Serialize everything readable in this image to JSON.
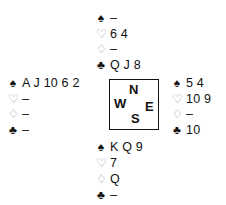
{
  "diagram": {
    "type": "bridge-hand-diagram",
    "compass": {
      "north": "N",
      "south": "S",
      "east": "E",
      "west": "W"
    },
    "hands": {
      "north": [
        {
          "suit": "spades",
          "symbol": "♠",
          "cards": "–"
        },
        {
          "suit": "hearts",
          "symbol": "♡",
          "cards": "6 4"
        },
        {
          "suit": "diamonds",
          "symbol": "♢",
          "cards": "–"
        },
        {
          "suit": "clubs",
          "symbol": "♣",
          "cards": "Q J 8"
        }
      ],
      "west": [
        {
          "suit": "spades",
          "symbol": "♠",
          "cards": "A J 10 6 2"
        },
        {
          "suit": "hearts",
          "symbol": "♡",
          "cards": "–"
        },
        {
          "suit": "diamonds",
          "symbol": "♢",
          "cards": "–"
        },
        {
          "suit": "clubs",
          "symbol": "♣",
          "cards": "–"
        }
      ],
      "east": [
        {
          "suit": "spades",
          "symbol": "♠",
          "cards": "5 4"
        },
        {
          "suit": "hearts",
          "symbol": "♡",
          "cards": "10 9"
        },
        {
          "suit": "diamonds",
          "symbol": "♢",
          "cards": "–"
        },
        {
          "suit": "clubs",
          "symbol": "♣",
          "cards": "10"
        }
      ],
      "south": [
        {
          "suit": "spades",
          "symbol": "♠",
          "cards": "K Q 9"
        },
        {
          "suit": "hearts",
          "symbol": "♡",
          "cards": "7"
        },
        {
          "suit": "diamonds",
          "symbol": "♢",
          "cards": "Q"
        },
        {
          "suit": "clubs",
          "symbol": "♣",
          "cards": "–"
        }
      ]
    }
  }
}
